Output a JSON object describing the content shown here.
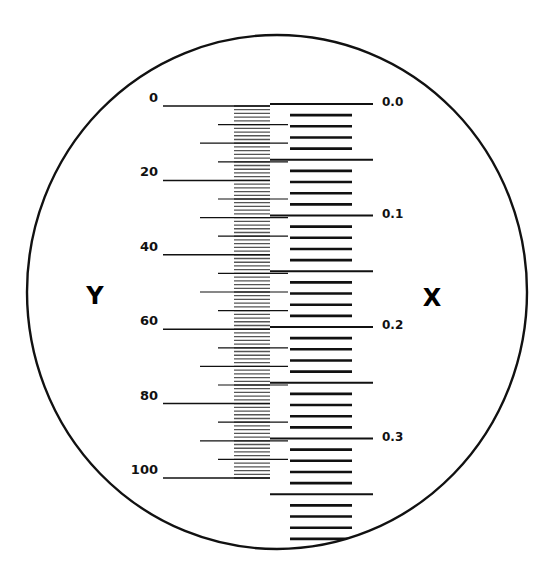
{
  "diagram": {
    "type": "reticle-scale",
    "colors": {
      "ink": "#111111",
      "band": "#555555",
      "background": "#ffffff"
    },
    "outline": {
      "cx": 277,
      "cy": 292,
      "rx": 250,
      "ry": 257
    },
    "axis_labels": {
      "y": {
        "text": "Y",
        "x": 95,
        "y": 304
      },
      "x": {
        "text": "X",
        "x": 432,
        "y": 306
      }
    },
    "y_scale": {
      "min": 0,
      "max": 100,
      "y_start": 106,
      "y_end": 478,
      "major_step": 20,
      "mid_step": 10,
      "minor_step": 5,
      "fine_step": 1,
      "tick_right_x": 270,
      "major_left_x": 163,
      "mid_left_x": 200,
      "minor_left_x": 218,
      "band": {
        "x1": 234,
        "x2": 270
      },
      "labels": [
        "0",
        "20",
        "40",
        "60",
        "80",
        "100"
      ],
      "label_right_x": 158
    },
    "x_scale": {
      "min": 0.0,
      "max": 0.39,
      "y_start": 104,
      "px_per_tenth": 111.5,
      "step": 0.01,
      "long_every": 5,
      "long_x1": 270,
      "long_x2": 373,
      "short_x1": 290,
      "short_x2": 352,
      "labels": [
        "0.0",
        "0.1",
        "0.2",
        "0.3"
      ],
      "label_x": 382,
      "tick_count": 39
    }
  }
}
